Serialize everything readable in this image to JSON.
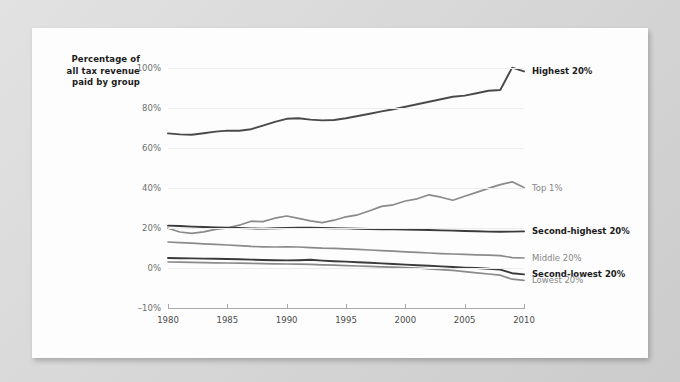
{
  "background_color": "#d2d2d2",
  "card_color": "#fdfdfd",
  "y_axis_title": {
    "line1": "Percentage of",
    "line2": "all tax revenue",
    "line3": "paid by group"
  },
  "chart_data": {
    "type": "line",
    "title": "",
    "subtitle": "",
    "xlabel": "",
    "ylabel": "Percentage of all tax revenue paid by group",
    "x_tick_labels": [
      "1980",
      "1985",
      "1990",
      "1995",
      "2000",
      "2005",
      "2010"
    ],
    "x_ticks": [
      1980,
      1985,
      1990,
      1995,
      2000,
      2005,
      2010
    ],
    "xlim": [
      1980,
      2010
    ],
    "y_tick_labels": [
      "100%",
      "80%",
      "60%",
      "40%",
      "20%",
      "0%",
      "-10%"
    ],
    "y_ticks": [
      100,
      80,
      60,
      40,
      20,
      0,
      -10
    ],
    "ylim": [
      -10,
      100
    ],
    "y_axis_broken_below": 0,
    "grid": true,
    "grid_color": "#ececec",
    "legend_position": "right-inline",
    "x": [
      1980,
      1981,
      1982,
      1983,
      1984,
      1985,
      1986,
      1987,
      1988,
      1989,
      1990,
      1991,
      1992,
      1993,
      1994,
      1995,
      1996,
      1997,
      1998,
      1999,
      2000,
      2001,
      2002,
      2003,
      2004,
      2005,
      2006,
      2007,
      2008,
      2009,
      2010
    ],
    "series": [
      {
        "name": "Highest 20%",
        "label": "Highest 20%",
        "color": "#4a4a4a",
        "width": 1.9,
        "label_style": "bold",
        "label_value_at_end": 98,
        "values": [
          67.3,
          66.8,
          66.6,
          67.4,
          68.2,
          68.7,
          68.6,
          69.4,
          71.2,
          73.1,
          74.6,
          74.9,
          74.2,
          73.8,
          74.0,
          74.9,
          76.0,
          77.1,
          78.3,
          79.4,
          80.6,
          81.9,
          83.1,
          84.4,
          85.6,
          86.2,
          87.4,
          88.6,
          89.0,
          100.2,
          98.3
        ]
      },
      {
        "name": "Top 1%",
        "label": "Top 1%",
        "color": "#8a8a8a",
        "width": 1.7,
        "label_style": "gray",
        "label_value_at_end": 40,
        "values": [
          19.9,
          18.0,
          17.3,
          18.1,
          19.3,
          20.0,
          21.4,
          23.4,
          23.2,
          24.9,
          26.0,
          24.8,
          23.6,
          22.7,
          23.9,
          25.6,
          26.6,
          28.6,
          30.8,
          31.6,
          33.5,
          34.6,
          36.6,
          35.4,
          33.9,
          35.9,
          37.8,
          39.8,
          41.7,
          43.1,
          40.2
        ]
      },
      {
        "name": "Second-highest 20%",
        "label": "Second-highest 20%",
        "color": "#3a3a3a",
        "width": 1.9,
        "label_style": "bold",
        "label_value_at_end": 18,
        "values": [
          21.2,
          21.0,
          20.7,
          20.5,
          20.3,
          20.2,
          20.0,
          19.8,
          19.7,
          19.9,
          20.0,
          20.1,
          20.1,
          20.0,
          19.9,
          19.8,
          19.6,
          19.5,
          19.4,
          19.3,
          19.2,
          19.1,
          19.0,
          18.8,
          18.7,
          18.5,
          18.4,
          18.2,
          18.1,
          18.2,
          18.3
        ]
      },
      {
        "name": "Middle 20%",
        "label": "Middle 20%",
        "color": "#8a8a8a",
        "width": 1.7,
        "label_style": "gray",
        "label_value_at_end": 5,
        "values": [
          13.0,
          12.7,
          12.4,
          12.1,
          11.8,
          11.5,
          11.2,
          10.8,
          10.6,
          10.5,
          10.6,
          10.5,
          10.2,
          9.9,
          9.8,
          9.6,
          9.3,
          9.0,
          8.7,
          8.4,
          8.1,
          7.8,
          7.5,
          7.2,
          7.0,
          6.8,
          6.6,
          6.4,
          6.2,
          5.2,
          5.0
        ]
      },
      {
        "name": "Second-lowest 20%",
        "label": "Second-lowest 20%",
        "color": "#3a3a3a",
        "width": 1.9,
        "label_style": "bold",
        "label_value_at_end": -1,
        "values": [
          5.0,
          4.9,
          4.8,
          4.7,
          4.6,
          4.5,
          4.4,
          4.2,
          4.0,
          3.9,
          3.8,
          3.9,
          4.1,
          3.7,
          3.4,
          3.2,
          2.9,
          2.6,
          2.3,
          2.0,
          1.7,
          1.4,
          1.1,
          0.8,
          0.5,
          0.2,
          0.0,
          -0.2,
          -0.4,
          -1.3,
          -1.6
        ]
      },
      {
        "name": "Lowest 20%",
        "label": "Lowest 20%",
        "color": "#8a8a8a",
        "width": 1.7,
        "label_style": "gray",
        "label_value_at_end": -3,
        "values": [
          3.0,
          2.9,
          2.8,
          2.7,
          2.6,
          2.5,
          2.4,
          2.3,
          2.2,
          2.1,
          2.0,
          1.9,
          1.8,
          1.6,
          1.4,
          1.2,
          1.0,
          0.8,
          0.6,
          0.4,
          0.2,
          0.0,
          -0.2,
          -0.4,
          -0.6,
          -0.9,
          -1.2,
          -1.5,
          -1.8,
          -2.8,
          -3.1
        ]
      }
    ]
  }
}
